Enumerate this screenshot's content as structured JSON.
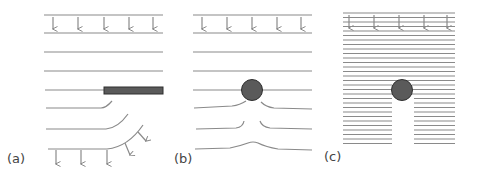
{
  "figure": {
    "panels": [
      {
        "id": "a",
        "label": "(a)",
        "obstacle": "flat plate (edge-on bar)",
        "description": "Parallel wavefronts meeting the edge of a barrier; wavefronts bend around the edge (diffraction)"
      },
      {
        "id": "b",
        "label": "(b)",
        "obstacle": "small circular object",
        "description": "Widely spaced wavefronts (long wavelength) diffract around a small object and rejoin behind it"
      },
      {
        "id": "c",
        "label": "(c)",
        "obstacle": "small circular object",
        "description": "Closely spaced wavefronts (short wavelength) leave a shadow behind the object"
      }
    ],
    "colors": {
      "line": "#8a8a8a",
      "arrow": "#8a8a8a",
      "obstacle_fill": "#5a5a5a",
      "obstacle_stroke": "#2e2e2e",
      "label": "#444444",
      "background": "#ffffff"
    }
  }
}
